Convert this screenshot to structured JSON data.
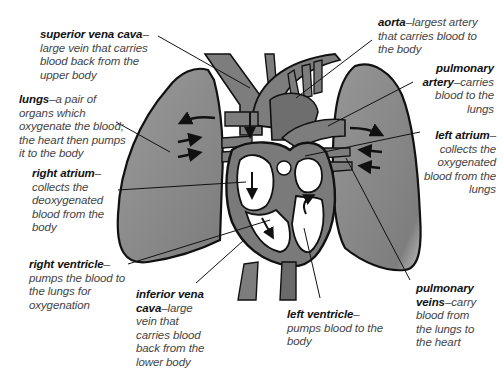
{
  "diagram": {
    "colors": {
      "tissue": "#8a8a8a",
      "vessel": "#7d7d7d",
      "outline": "#111111",
      "chamber": "#ffffff",
      "text_term": "#111111",
      "text_desc": "#444444"
    },
    "labels": [
      {
        "id": "superior-vena-cava",
        "term": "superior vena cava",
        "desc": "–large vein that carries blood back from the upper body"
      },
      {
        "id": "aorta",
        "term": "aorta",
        "desc": "–largest artery that carries blood to the body"
      },
      {
        "id": "pulmonary-artery",
        "term": "pulmonary artery",
        "desc": "–carries blood to the lungs"
      },
      {
        "id": "lungs",
        "term": "lungs",
        "desc": "–a pair of organs which oxygenate the blood; the heart then pumps it to the body"
      },
      {
        "id": "left-atrium",
        "term": "left atrium",
        "desc": "–collects the oxygenated blood from the lungs"
      },
      {
        "id": "right-atrium",
        "term": "right atrium",
        "desc": "–collects the deoxygenated blood from the body"
      },
      {
        "id": "right-ventricle",
        "term": "right ventricle",
        "desc": "–pumps the blood to the lungs for oxygenation"
      },
      {
        "id": "inferior-vena-cava",
        "term": "inferior vena cava",
        "desc": "–large vein that carries blood back from the lower body"
      },
      {
        "id": "left-ventricle",
        "term": "left ventricle",
        "desc": "–pumps blood to the body"
      },
      {
        "id": "pulmonary-veins",
        "term": "pulmonary veins",
        "desc": "–carry blood from the lungs to the heart"
      }
    ]
  }
}
